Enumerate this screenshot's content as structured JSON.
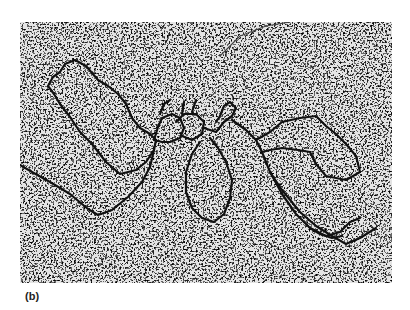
{
  "figure": {
    "label": "(b)",
    "content": "electron micrograph of DNA strand with loops on grainy background",
    "colors": {
      "background": "#ffffff",
      "grain_dark": "#3a3a3a",
      "grain_light": "#d8d8d8",
      "strand": "#111111"
    }
  }
}
